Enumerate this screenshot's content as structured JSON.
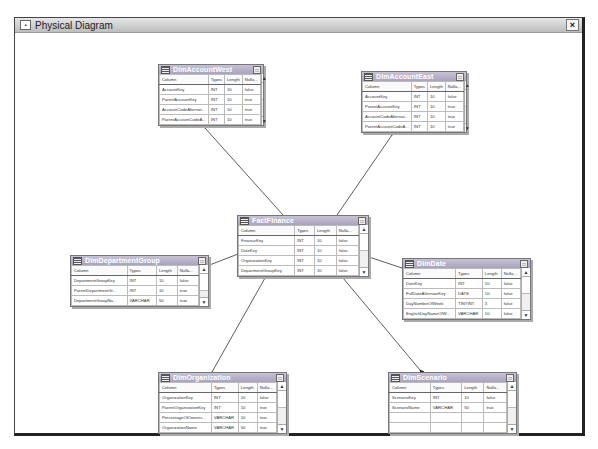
{
  "window": {
    "title": "Physical Diagram",
    "close_label": "×",
    "icon": "diagram-icon"
  },
  "columns_header": [
    "Column",
    "Types",
    "Length",
    "Nulla..."
  ],
  "tables": {
    "west": {
      "name": "DimAccountWest",
      "rows": [
        [
          "AccountKey",
          "INT",
          "10",
          "false"
        ],
        [
          "ParentAccountKey",
          "INT",
          "10",
          "true"
        ],
        [
          "AccountCodeAlternat...",
          "INT",
          "10",
          "true"
        ],
        [
          "ParentAccountCodeA...",
          "INT",
          "10",
          "true"
        ]
      ]
    },
    "east": {
      "name": "DimAccountEast",
      "rows": [
        [
          "AccountKey",
          "INT",
          "10",
          "false"
        ],
        [
          "ParentAccountKey",
          "INT",
          "10",
          "true"
        ],
        [
          "AccountCodeAlternat...",
          "INT",
          "10",
          "true"
        ],
        [
          "ParentAccountCodeA...",
          "INT",
          "10",
          "true"
        ]
      ]
    },
    "fact": {
      "name": "FactFinance",
      "rows": [
        [
          "FinanceKey",
          "INT",
          "10",
          "false"
        ],
        [
          "DateKey",
          "INT",
          "10",
          "false"
        ],
        [
          "OrganizationKey",
          "INT",
          "10",
          "false"
        ],
        [
          "DepartmentGroupKey",
          "INT",
          "10",
          "false"
        ]
      ]
    },
    "dept": {
      "name": "DimDepartmentGroup",
      "rows": [
        [
          "DepartmentGroupKey",
          "INT",
          "10",
          "false"
        ],
        [
          "ParentDepartmentGr...",
          "INT",
          "10",
          "true"
        ],
        [
          "DepartmentGroupNa...",
          "VARCHAR",
          "50",
          "true"
        ]
      ]
    },
    "date": {
      "name": "DimDate",
      "rows": [
        [
          "DateKey",
          "INT",
          "10",
          "false"
        ],
        [
          "FullDateAlternateKey",
          "DATE",
          "10",
          "false"
        ],
        [
          "DayNumberOfWeek",
          "TINYINT",
          "3",
          "false"
        ],
        [
          "EnglishDayNameOfW...",
          "VARCHAR",
          "10",
          "false"
        ]
      ]
    },
    "org": {
      "name": "DimOrganization",
      "rows": [
        [
          "OrganizationKey",
          "INT",
          "10",
          "false"
        ],
        [
          "ParentOrganizationKey",
          "INT",
          "10",
          "true"
        ],
        [
          "PercentageOfOwners...",
          "VARCHAR",
          "10",
          "true"
        ],
        [
          "OrganizationName",
          "VARCHAR",
          "50",
          "true"
        ]
      ]
    },
    "scenario": {
      "name": "DimScenario",
      "rows": [
        [
          "ScenarioKey",
          "INT",
          "10",
          "false"
        ],
        [
          "ScenarioName",
          "VARCHAR",
          "50",
          "true"
        ],
        [
          "",
          "",
          "",
          ""
        ],
        [
          "",
          "",
          "",
          ""
        ]
      ]
    }
  }
}
